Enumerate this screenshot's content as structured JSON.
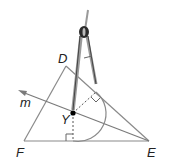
{
  "figure": {
    "points": {
      "D": {
        "label": "D",
        "x": 66,
        "y": 66
      },
      "E": {
        "label": "E",
        "x": 149,
        "y": 141
      },
      "F": {
        "label": "F",
        "x": 24,
        "y": 141
      },
      "Y": {
        "label": "Y",
        "x": 73,
        "y": 113
      }
    },
    "line": {
      "label": "m"
    },
    "colors": {
      "line": "#8a8a8a",
      "dot": "#000000",
      "compass_dark": "#333333",
      "compass_light": "#9a9a9a"
    }
  }
}
